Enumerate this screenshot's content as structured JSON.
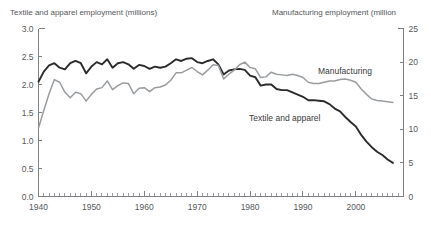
{
  "chart_data": {
    "type": "line",
    "title": "",
    "xlabel": "",
    "left_axis_title": "Textile and apparel employment (millions)",
    "right_axis_title": "Manufacturing employment (million",
    "ylabel": "Textile and apparel employment (millions)",
    "y2label": "Manufacturing employment (million",
    "grid": false,
    "legend_position": "inline-annotation",
    "xlim": [
      1940,
      2009
    ],
    "ylim": [
      0.0,
      3.0
    ],
    "y2lim": [
      0,
      25
    ],
    "x_tick_labels": [
      "1940",
      "1950",
      "1960",
      "1970",
      "1980",
      "1990",
      "2000"
    ],
    "x_ticks": [
      1940,
      1950,
      1960,
      1970,
      1980,
      1990,
      2000
    ],
    "x_minor_tick_interval": 1,
    "left_tick_labels": [
      "0.0",
      "0.5",
      "1.0",
      "1.5",
      "2.0",
      "2.5",
      "3.0"
    ],
    "left_ticks": [
      0.0,
      0.5,
      1.0,
      1.5,
      2.0,
      2.5,
      3.0
    ],
    "right_tick_labels": [
      "0",
      "5",
      "10",
      "15",
      "20",
      "25"
    ],
    "right_ticks": [
      0,
      5,
      10,
      15,
      20,
      25
    ],
    "annotations": [
      {
        "text": "Manufacturing",
        "x": 1994,
        "y_axis": "right",
        "color": "#6e7174"
      },
      {
        "text": "Textile and apparel",
        "x": 1982,
        "y_axis": "left",
        "color": "#2b2b2b"
      }
    ],
    "series": [
      {
        "name": "Textile and apparel",
        "axis": "left",
        "unit": "millions",
        "color": "#2b2b2b",
        "line_width": 1.9,
        "x": [
          1940,
          1941,
          1942,
          1943,
          1944,
          1945,
          1946,
          1947,
          1948,
          1949,
          1950,
          1951,
          1952,
          1953,
          1954,
          1955,
          1956,
          1957,
          1958,
          1959,
          1960,
          1961,
          1962,
          1963,
          1964,
          1965,
          1966,
          1967,
          1968,
          1969,
          1970,
          1971,
          1972,
          1973,
          1974,
          1975,
          1976,
          1977,
          1978,
          1979,
          1980,
          1981,
          1982,
          1983,
          1984,
          1985,
          1986,
          1987,
          1988,
          1989,
          1990,
          1991,
          1992,
          1993,
          1994,
          1995,
          1996,
          1997,
          1998,
          1999,
          2000,
          2001,
          2002,
          2003,
          2004,
          2005,
          2006,
          2007
        ],
        "values": [
          2.05,
          2.23,
          2.34,
          2.38,
          2.3,
          2.27,
          2.38,
          2.42,
          2.38,
          2.2,
          2.32,
          2.4,
          2.36,
          2.45,
          2.3,
          2.38,
          2.4,
          2.36,
          2.28,
          2.35,
          2.33,
          2.28,
          2.32,
          2.3,
          2.32,
          2.38,
          2.45,
          2.42,
          2.46,
          2.47,
          2.4,
          2.38,
          2.42,
          2.45,
          2.36,
          2.18,
          2.25,
          2.27,
          2.28,
          2.26,
          2.16,
          2.13,
          1.98,
          2.0,
          2.0,
          1.92,
          1.9,
          1.9,
          1.86,
          1.82,
          1.78,
          1.72,
          1.72,
          1.71,
          1.7,
          1.65,
          1.57,
          1.52,
          1.42,
          1.33,
          1.25,
          1.1,
          0.98,
          0.88,
          0.8,
          0.74,
          0.66,
          0.6
        ]
      },
      {
        "name": "Manufacturing",
        "axis": "right",
        "unit": "millions",
        "color": "#9a9da0",
        "line_width": 1.5,
        "x": [
          1940,
          1941,
          1942,
          1943,
          1944,
          1945,
          1946,
          1947,
          1948,
          1949,
          1950,
          1951,
          1952,
          1953,
          1954,
          1955,
          1956,
          1957,
          1958,
          1959,
          1960,
          1961,
          1962,
          1963,
          1964,
          1965,
          1966,
          1967,
          1968,
          1969,
          1970,
          1971,
          1972,
          1973,
          1974,
          1975,
          1976,
          1977,
          1978,
          1979,
          1980,
          1981,
          1982,
          1983,
          1984,
          1985,
          1986,
          1987,
          1988,
          1989,
          1990,
          1991,
          1992,
          1993,
          1994,
          1995,
          1996,
          1997,
          1998,
          1999,
          2000,
          2001,
          2002,
          2003,
          2004,
          2005,
          2006,
          2007
        ],
        "values": [
          10.2,
          12.8,
          15.3,
          17.4,
          17.0,
          15.5,
          14.7,
          15.5,
          15.3,
          14.2,
          15.2,
          16.0,
          16.2,
          17.2,
          15.9,
          16.5,
          16.9,
          16.8,
          15.3,
          16.1,
          16.2,
          15.6,
          16.2,
          16.3,
          16.6,
          17.3,
          18.4,
          18.4,
          18.8,
          19.2,
          18.6,
          18.1,
          18.8,
          19.6,
          19.5,
          17.5,
          18.2,
          18.8,
          19.6,
          20.0,
          19.2,
          19.0,
          17.7,
          17.8,
          18.5,
          18.2,
          18.1,
          18.0,
          18.2,
          18.0,
          17.7,
          17.0,
          16.8,
          16.8,
          17.0,
          17.2,
          17.2,
          17.4,
          17.5,
          17.3,
          17.0,
          16.0,
          15.2,
          14.5,
          14.3,
          14.2,
          14.1,
          14.0
        ]
      }
    ]
  },
  "figure": {
    "background_color": "#ffffff",
    "axis_color": "#7e8184",
    "text_color": "#55585c"
  }
}
